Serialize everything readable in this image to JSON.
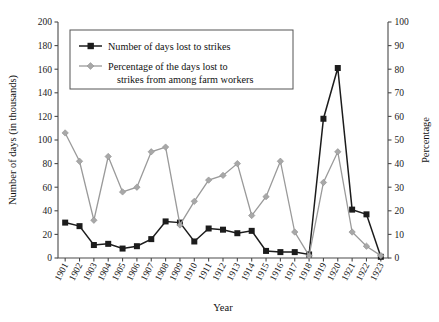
{
  "chart_data": {
    "type": "line",
    "title": "",
    "xlabel": "Year",
    "ylabel": "Number of days (in thousands)",
    "y2label": "Percentage",
    "grid": false,
    "legend_position": "top-left-inside",
    "categories": [
      "1901",
      "1902",
      "1903",
      "1904",
      "1905",
      "1906",
      "1907",
      "1908",
      "1909",
      "1910",
      "1911",
      "1912",
      "1913",
      "1914",
      "1915",
      "1916",
      "1917",
      "1918",
      "1919",
      "1920",
      "1921",
      "1922",
      "1923"
    ],
    "ylim": [
      0,
      200
    ],
    "yticks": [
      0,
      20,
      40,
      60,
      80,
      100,
      120,
      140,
      160,
      180,
      200
    ],
    "y2lim": [
      0,
      100
    ],
    "y2ticks": [
      0,
      10,
      20,
      30,
      40,
      50,
      60,
      70,
      80,
      90,
      100
    ],
    "series": [
      {
        "name": "Number of days lost to strikes",
        "axis": "left",
        "color": "#1c1c1c",
        "marker": "square",
        "values": [
          30,
          27,
          11,
          12,
          8,
          10,
          16,
          31,
          30,
          14,
          25,
          24,
          21,
          23,
          6,
          5,
          5,
          3,
          118,
          161,
          41,
          37,
          1
        ]
      },
      {
        "name": "Percentage of the days lost to strikes from among farm workers",
        "axis": "right",
        "color": "#a8a8a8",
        "marker": "diamond",
        "values": [
          53,
          41,
          16,
          43,
          28,
          30,
          45,
          47,
          14,
          24,
          33,
          35,
          40,
          18,
          26,
          41,
          11,
          1,
          32,
          45,
          11,
          5,
          1
        ]
      }
    ]
  },
  "legend": {
    "entries": [
      {
        "label": "Number of days lost to strikes"
      },
      {
        "label": "Percentage of the days lost to",
        "label2": "strikes from among farm workers"
      }
    ]
  }
}
